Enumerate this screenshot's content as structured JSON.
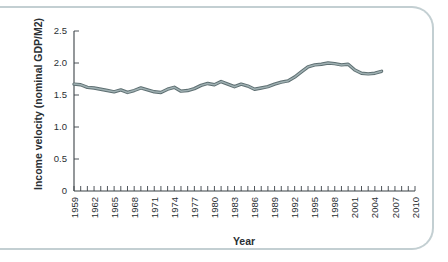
{
  "figure": {
    "frame_color": "#c3cfd2",
    "background": "#ffffff"
  },
  "chart_data": {
    "type": "line",
    "title": "",
    "xlabel": "Year",
    "ylabel": "Income velocity (nominal GDP/M2)",
    "xlim": [
      1959,
      2010
    ],
    "ylim": [
      0,
      2.5
    ],
    "grid": false,
    "legend": null,
    "line_color": "#5e6f72",
    "highlight_color": "#9fb0b2",
    "y_ticks": [
      0,
      0.5,
      1.0,
      1.5,
      2.0,
      2.5
    ],
    "y_tick_labels": [
      "0",
      "0.5",
      "1.0",
      "1.5",
      "2.0",
      "2.5"
    ],
    "x_tick_labels": [
      "1959",
      "1962",
      "1965",
      "1968",
      "1971",
      "1974",
      "1977",
      "1980",
      "1983",
      "1986",
      "1989",
      "1992",
      "1995",
      "1998",
      "2001",
      "2004",
      "2007",
      "2010"
    ],
    "x_tick_values": [
      1959,
      1962,
      1965,
      1968,
      1971,
      1974,
      1977,
      1980,
      1983,
      1986,
      1989,
      1992,
      1995,
      1998,
      2001,
      2004,
      2007,
      2010
    ],
    "x_minor_step": 1,
    "x": [
      1959,
      1960,
      1961,
      1962,
      1963,
      1964,
      1965,
      1966,
      1967,
      1968,
      1969,
      1970,
      1971,
      1972,
      1973,
      1974,
      1975,
      1976,
      1977,
      1978,
      1979,
      1980,
      1981,
      1982,
      1983,
      1984,
      1985,
      1986,
      1987,
      1988,
      1989,
      1990,
      1991,
      1992,
      1993,
      1994,
      1995,
      1996,
      1997,
      1998,
      1999,
      2000,
      2001,
      2002,
      2003,
      2004,
      2005
    ],
    "values": [
      1.67,
      1.66,
      1.62,
      1.61,
      1.59,
      1.57,
      1.55,
      1.58,
      1.54,
      1.57,
      1.61,
      1.58,
      1.55,
      1.54,
      1.59,
      1.62,
      1.56,
      1.57,
      1.6,
      1.65,
      1.68,
      1.66,
      1.71,
      1.67,
      1.63,
      1.67,
      1.64,
      1.59,
      1.61,
      1.63,
      1.67,
      1.7,
      1.72,
      1.78,
      1.86,
      1.94,
      1.97,
      1.98,
      2.0,
      1.99,
      1.97,
      1.98,
      1.89,
      1.84,
      1.83,
      1.84,
      1.87
    ]
  }
}
